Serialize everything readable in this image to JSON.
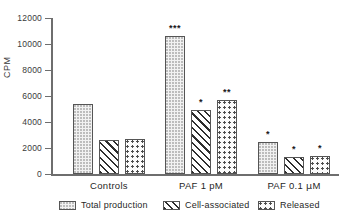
{
  "chart_data": {
    "type": "bar",
    "title": "",
    "xlabel": "",
    "ylabel": "CPM",
    "ylim": [
      0,
      12000
    ],
    "yticks": [
      0,
      2000,
      4000,
      6000,
      8000,
      10000,
      12000
    ],
    "ytick_labels": [
      "0",
      "2000",
      "4000",
      "6000",
      "8000",
      "10000",
      "12000"
    ],
    "grid": false,
    "legend_position": "bottom",
    "categories": [
      "Controls",
      "PAF 1 pM",
      "PAF 0.1 μM"
    ],
    "series": [
      {
        "name": "Total production",
        "fill": "stippled-light",
        "values": [
          5350,
          10600,
          2500
        ],
        "annotations": [
          "",
          "***",
          "*"
        ]
      },
      {
        "name": "Cell-associated",
        "fill": "diagonal-hatch",
        "values": [
          2600,
          4900,
          1300
        ],
        "annotations": [
          "",
          "*",
          "*"
        ]
      },
      {
        "name": "Released",
        "fill": "coarse-dots",
        "values": [
          2700,
          5700,
          1400
        ],
        "annotations": [
          "",
          "**",
          "*"
        ]
      }
    ]
  },
  "axes": {
    "y_label": "CPM",
    "y_ticks": [
      "12000",
      "10000",
      "8000",
      "6000",
      "4000",
      "2000",
      "0"
    ]
  },
  "groups": [
    {
      "label_plain": "Controls",
      "label_pre": "Controls",
      "label_mu": "",
      "label_post": ""
    },
    {
      "label_plain": "PAF 1 pM",
      "label_pre": "PAF 1 pM",
      "label_mu": "",
      "label_post": ""
    },
    {
      "label_plain": "PAF 0.1 μM",
      "label_pre": "PAF 0.1 ",
      "label_mu": "μ",
      "label_post": "M"
    }
  ],
  "legend": {
    "items": [
      {
        "label": "Total production"
      },
      {
        "label": "Cell-associated"
      },
      {
        "label": "Released"
      }
    ]
  },
  "colors": {
    "axis": "#6e6e6e",
    "bar_outline": "#555555",
    "text": "#1f1f1f"
  }
}
